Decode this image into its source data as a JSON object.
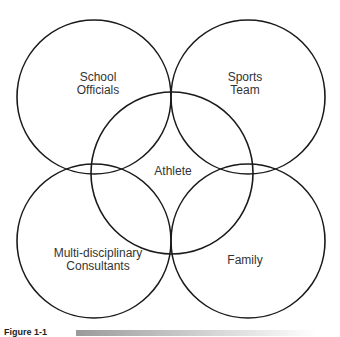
{
  "diagram": {
    "type": "venn",
    "stroke_color": "#1a1a1a",
    "text_color": "#333333",
    "circles": [
      {
        "id": "school-officials",
        "label_lines": [
          "School",
          "Officials"
        ],
        "cx": 94,
        "cy": 97,
        "r": 77
      },
      {
        "id": "sports-team",
        "label_lines": [
          "Sports",
          "Team"
        ],
        "cx": 248,
        "cy": 97,
        "r": 77
      },
      {
        "id": "athlete",
        "label_lines": [
          "Athlete"
        ],
        "cx": 172,
        "cy": 173,
        "r": 81
      },
      {
        "id": "multidisciplinary-consultants",
        "label_lines": [
          "Multi-disciplinary",
          "Consultants"
        ],
        "cx": 94,
        "cy": 241,
        "r": 77
      },
      {
        "id": "family",
        "label_lines": [
          "Family"
        ],
        "cx": 248,
        "cy": 241,
        "r": 77
      }
    ]
  },
  "labels": {
    "school_officials": {
      "line1": "School",
      "line2": "Officials"
    },
    "sports_team": {
      "line1": "Sports",
      "line2": "Team"
    },
    "athlete": "Athlete",
    "consultants": {
      "line1": "Multi-disciplinary",
      "line2": "Consultants"
    },
    "family": "Family"
  },
  "caption": {
    "label": "Figure 1-1"
  }
}
